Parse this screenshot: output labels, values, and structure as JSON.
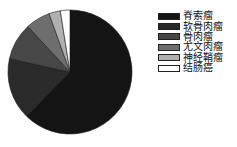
{
  "chart_data": {
    "type": "pie",
    "title": "",
    "categories": [
      "脊索瘤",
      "软骨肉瘤",
      "骨肉瘤",
      "尤文肉瘤",
      "神经鞘瘤",
      "结肠癌"
    ],
    "values": [
      62.5,
      16.0,
      9.7,
      6.4,
      3.0,
      2.5
    ],
    "unit": "%",
    "start_angle_deg": 0,
    "direction": "clockwise",
    "colors": [
      "#141414",
      "#2a2a2a",
      "#474747",
      "#6e6e6e",
      "#b0b0b0",
      "#ffffff"
    ],
    "legend_position": "right"
  },
  "legend": {
    "items": [
      {
        "label": "脊索瘤",
        "color": "#141414"
      },
      {
        "label": "软骨肉瘤",
        "color": "#2a2a2a"
      },
      {
        "label": "骨肉瘤",
        "color": "#474747"
      },
      {
        "label": "尤文肉瘤",
        "color": "#6e6e6e"
      },
      {
        "label": "神经鞘瘤",
        "color": "#b0b0b0"
      },
      {
        "label": "结肠癌",
        "color": "#ffffff"
      }
    ]
  }
}
